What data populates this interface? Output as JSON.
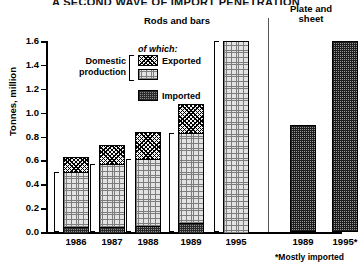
{
  "chart_data": {
    "type": "bar",
    "title": "A SECOND WAVE OF IMPORT PENETRATION",
    "ylabel": "Tonnes, million",
    "xlabel": "",
    "ylim": [
      0.0,
      1.6
    ],
    "ytick_labels": [
      "1.6",
      "1.4",
      "1.2",
      "1.0",
      "0.8",
      "0.6",
      "0.4",
      "0.2",
      "0.0"
    ],
    "ytick_values": [
      1.6,
      1.4,
      1.2,
      1.0,
      0.8,
      0.6,
      0.4,
      0.2,
      0.0
    ],
    "grid": false,
    "legend_position": "inside-upper-left",
    "panels": [
      {
        "name": "rods-and-bars",
        "label": "Rods and bars",
        "categories": [
          "1986",
          "1987",
          "1988",
          "1989",
          "1995"
        ],
        "series": [
          {
            "name": "Imported",
            "values": [
              0.05,
              0.05,
              0.06,
              0.08,
              0.0
            ]
          },
          {
            "name": "Domestic production (not exported)",
            "values": [
              0.45,
              0.52,
              0.55,
              0.75,
              1.6
            ]
          },
          {
            "name": "Exported",
            "values": [
              0.13,
              0.16,
              0.23,
              0.24,
              0.0
            ]
          }
        ],
        "totals": [
          0.63,
          0.73,
          0.84,
          1.07,
          1.6
        ]
      },
      {
        "name": "plate-and-sheet",
        "label": "Plate and\nsheet",
        "categories": [
          "1989",
          "1995*"
        ],
        "series": [
          {
            "name": "Total (mostly imported)",
            "values": [
              0.9,
              1.6
            ]
          }
        ],
        "totals": [
          0.9,
          1.6
        ]
      }
    ],
    "annotations": [
      "*Mostly imported"
    ]
  },
  "legend": {
    "of_which": "of which:",
    "domestic": "Domestic\nproduction",
    "exported": "Exported",
    "imported": "Imported"
  },
  "footnote": "*Mostly imported",
  "colors": {
    "exported_fill": "#f2f2f2",
    "domestic_fill": "#e3e3e3",
    "imported_fill": "#8e8e8e",
    "outline": "#000000",
    "divider": "#555555"
  }
}
